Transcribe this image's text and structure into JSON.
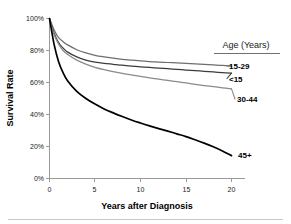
{
  "chart_data": {
    "type": "line",
    "title": "",
    "xlabel": "Years after Diagnosis",
    "ylabel": "Survival Rate",
    "xlim": [
      0,
      21
    ],
    "ylim": [
      0,
      100
    ],
    "grid": false,
    "legend_position": "right",
    "legend_title": "Age (Years)",
    "xticks": [
      0,
      5,
      10,
      15,
      20
    ],
    "xticklabels": [
      "0",
      "5",
      "10",
      "15",
      "20"
    ],
    "yticks": [
      0,
      20,
      40,
      60,
      80,
      100
    ],
    "yticklabels": [
      "0%",
      "20%",
      "40%",
      "60%",
      "80%",
      "100%"
    ],
    "x": [
      0,
      0.5,
      1,
      1.5,
      2,
      3,
      4,
      5,
      6,
      7,
      8,
      9,
      10,
      11,
      12,
      13,
      14,
      15,
      16,
      17,
      18,
      19,
      20
    ],
    "series": [
      {
        "name": "15-29",
        "label": "15-29",
        "color": "#6e6e6e",
        "values": [
          100,
          93,
          88,
          85.5,
          83.5,
          80.5,
          78.5,
          77,
          76,
          75.2,
          74.5,
          74,
          73.5,
          73.1,
          72.8,
          72.5,
          72.2,
          71.9,
          71.6,
          71.3,
          71.0,
          70.7,
          70.3
        ]
      },
      {
        "name": "<15",
        "label": "<15",
        "color": "#3c3c3c",
        "values": [
          100,
          91,
          85,
          81.5,
          79,
          76,
          74,
          72.8,
          72,
          71.4,
          70.8,
          70.3,
          69.8,
          69.4,
          69.0,
          68.6,
          68.2,
          67.8,
          67.4,
          67.0,
          66.6,
          66.2,
          65.8
        ]
      },
      {
        "name": "30-44",
        "label": "30-44",
        "color": "#8a8a8a",
        "values": [
          100,
          90,
          84,
          80,
          77.5,
          74,
          71.5,
          69.5,
          68,
          66.8,
          65.7,
          64.7,
          63.8,
          62.9,
          62.1,
          61.3,
          60.5,
          59.7,
          58.9,
          58.1,
          57.4,
          56.7,
          56.0
        ]
      },
      {
        "name": "45+",
        "label": "45+",
        "color": "#000000",
        "values": [
          100,
          84,
          73,
          66,
          61,
          54.5,
          50,
          46.5,
          43.5,
          41,
          38.7,
          36.6,
          34.7,
          32.9,
          31.2,
          29.6,
          27.9,
          26.2,
          24.2,
          22.1,
          19.8,
          17.2,
          14.3
        ]
      }
    ],
    "legend_entries": [
      {
        "label": "15-29",
        "color": "#6e6e6e"
      },
      {
        "label": "<15",
        "color": "#3c3c3c"
      },
      {
        "label": "30-44",
        "color": "#8a8a8a"
      },
      {
        "label": "45+",
        "color": "#000000"
      }
    ]
  }
}
